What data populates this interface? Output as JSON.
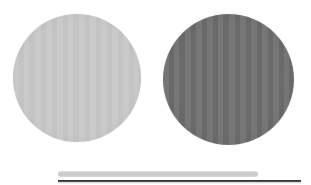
{
  "scene": {
    "title": "Two circular abrasive discs with scale bars",
    "background_color": "#ffffff",
    "width": 311,
    "height": 185
  },
  "objects": [
    {
      "name": "left-disc",
      "shape": "circle",
      "color": "#c6c6c6",
      "color_label": "light gray",
      "center_x": 77,
      "center_y": 78,
      "diameter": 128,
      "texture": "fine vertical scan striping"
    },
    {
      "name": "right-disc",
      "shape": "circle",
      "color": "#6f6f6f",
      "color_label": "medium dark gray",
      "center_x": 228,
      "center_y": 79,
      "diameter": 131,
      "texture": "fine vertical scan striping"
    },
    {
      "name": "upper-bar",
      "shape": "rounded-bar",
      "color": "#c8c8c8",
      "color_label": "light gray",
      "x": 58,
      "y": 171,
      "width": 200,
      "height": 6
    },
    {
      "name": "lower-bar",
      "shape": "rule",
      "color": "#333333",
      "color_label": "near black",
      "x": 58,
      "y": 180,
      "width": 243,
      "height": 2
    }
  ],
  "palette": {
    "background": "#ffffff",
    "light_gray": "#c6c6c6",
    "dark_gray": "#6f6f6f",
    "bar_light": "#c8c8c8",
    "bar_dark": "#333333"
  }
}
